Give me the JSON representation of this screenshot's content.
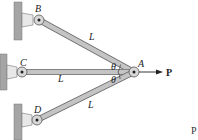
{
  "diagram": {
    "points": {
      "A": {
        "label": "A",
        "x": 134,
        "y": 72
      },
      "B": {
        "label": "B",
        "x": 39,
        "y": 20
      },
      "C": {
        "label": "C",
        "x": 22,
        "y": 72
      },
      "D": {
        "label": "D",
        "x": 37,
        "y": 120
      }
    },
    "bars": [
      {
        "from": "B",
        "to": "A",
        "label": "L"
      },
      {
        "from": "C",
        "to": "A",
        "label": "L"
      },
      {
        "from": "D",
        "to": "A",
        "label": "L"
      }
    ],
    "angles": [
      {
        "label": "θ",
        "between": "AB-AC"
      },
      {
        "label": "θ",
        "between": "AC-AD"
      }
    ],
    "load": {
      "label": "P",
      "direction": "right",
      "at": "A"
    },
    "stray_text": "P",
    "colors": {
      "bar": "#bdbdbd",
      "bar_edge": "#6b6b6b",
      "wall": "#9a9a9a",
      "text": "#222222"
    }
  }
}
